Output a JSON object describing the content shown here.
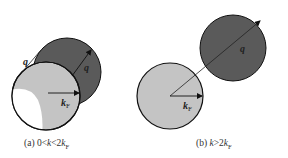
{
  "colors": {
    "fermi_sphere": "#c4c4c4",
    "shifted_sphere": "#5a5a5a",
    "allowed_region": "#ffffff",
    "stroke": "#111111",
    "background": "#ffffff"
  },
  "panels": [
    {
      "id": "a",
      "caption": {
        "prefix": "(a) 0<",
        "var": "k",
        "mid": "<2",
        "kf": "k",
        "kf_sub": "F"
      },
      "labels": {
        "q_outer": "q",
        "q_inner": "q",
        "kf": "k",
        "kf_sub": "F"
      },
      "geometry": {
        "fermi_circle": {
          "cx": 46,
          "cy": 96,
          "r": 34
        },
        "shifted_circle": {
          "cx": 67,
          "cy": 72,
          "r": 34
        }
      }
    },
    {
      "id": "b",
      "caption": {
        "prefix": "(b) ",
        "var": "k",
        "mid": ">2",
        "kf": "k",
        "kf_sub": "F"
      },
      "labels": {
        "q": "q",
        "kf": "k",
        "kf_sub": "F"
      },
      "geometry": {
        "fermi_circle": {
          "cx": 170,
          "cy": 96,
          "r": 33
        },
        "shifted_circle": {
          "cx": 233,
          "cy": 48,
          "r": 33
        }
      }
    }
  ]
}
